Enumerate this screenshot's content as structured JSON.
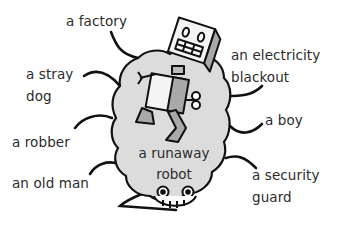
{
  "diagram": {
    "type": "spider-diagram",
    "center": {
      "line1": "a runaway",
      "line2": "robot"
    },
    "legs": [
      {
        "id": "factory",
        "lines": [
          "a factory"
        ]
      },
      {
        "id": "stray-dog",
        "lines": [
          "a stray",
          "dog"
        ]
      },
      {
        "id": "robber",
        "lines": [
          "a robber"
        ]
      },
      {
        "id": "old-man",
        "lines": [
          "an old man"
        ]
      },
      {
        "id": "electricity-blackout",
        "lines": [
          "an electricity",
          "blackout"
        ]
      },
      {
        "id": "boy",
        "lines": [
          "a boy"
        ]
      },
      {
        "id": "security-guard",
        "lines": [
          "a security",
          "guard"
        ]
      }
    ],
    "colors": {
      "blob_fill": "#dcdcdc",
      "outline": "#111111",
      "text": "#2b2b2b",
      "robot_fill": "#f4f4f4",
      "robot_shade": "#a9a9a9"
    }
  }
}
